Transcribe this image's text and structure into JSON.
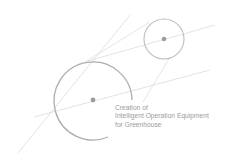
{
  "caption": {
    "line1": "Creation of",
    "line2": "Intelligent Operation Equipment",
    "line3": "for Greenhouse"
  },
  "colors": {
    "line": "#c8c8c8",
    "circle": "#b8b8b8",
    "dot": "#999999",
    "text": "#9a9a9a"
  }
}
